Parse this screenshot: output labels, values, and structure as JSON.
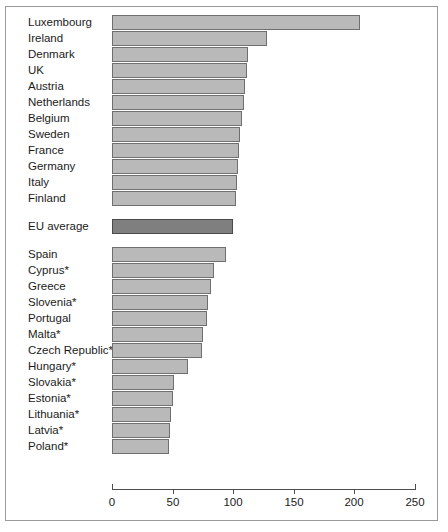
{
  "chart_data": {
    "type": "bar",
    "orientation": "horizontal",
    "title": "",
    "subtitle": "",
    "xlabel": "",
    "ylabel": "",
    "xlim": [
      0,
      250
    ],
    "xticks": [
      0,
      50,
      100,
      150,
      200,
      250
    ],
    "xticklabels": [
      "0",
      "50",
      "100",
      "150",
      "200",
      "250"
    ],
    "grid": false,
    "legend": null,
    "note": "EU average bar drawn in a darker shade; countries marked * are accession/new member states",
    "groups": [
      {
        "name": "above-average",
        "categories": [
          "Luxembourg",
          "Ireland",
          "Denmark",
          "UK",
          "Austria",
          "Netherlands",
          "Belgium",
          "Sweden",
          "France",
          "Germany",
          "Italy",
          "Finland"
        ],
        "values": [
          205,
          128,
          112,
          111,
          110,
          109,
          107,
          106,
          105,
          104,
          103,
          102
        ]
      },
      {
        "name": "average",
        "categories": [
          "EU average"
        ],
        "values": [
          100
        ]
      },
      {
        "name": "below-average",
        "categories": [
          "Spain",
          "Cyprus*",
          "Greece",
          "Slovenia*",
          "Portugal",
          "Malta*",
          "Czech Republic*",
          "Hungary*",
          "Slovakia*",
          "Estonia*",
          "Lithuania*",
          "Latvia*",
          "Poland*"
        ],
        "values": [
          94,
          84,
          82,
          79,
          78,
          75,
          74,
          63,
          51,
          50,
          49,
          48,
          47
        ]
      }
    ],
    "categories": [
      "Luxembourg",
      "Ireland",
      "Denmark",
      "UK",
      "Austria",
      "Netherlands",
      "Belgium",
      "Sweden",
      "France",
      "Germany",
      "Italy",
      "Finland",
      "EU average",
      "Spain",
      "Cyprus*",
      "Greece",
      "Slovenia*",
      "Portugal",
      "Malta*",
      "Czech Republic*",
      "Hungary*",
      "Slovakia*",
      "Estonia*",
      "Lithuania*",
      "Latvia*",
      "Poland*"
    ],
    "values": [
      205,
      128,
      112,
      111,
      110,
      109,
      107,
      106,
      105,
      104,
      103,
      102,
      100,
      94,
      84,
      82,
      79,
      78,
      75,
      74,
      63,
      51,
      50,
      49,
      48,
      47
    ],
    "colors": {
      "bar_fill": "#b9b9b9",
      "bar_stroke": "#6f6f6f",
      "eu_fill": "#7f7f7f",
      "eu_stroke": "#4a4a4a",
      "axis": "#4d4d4d",
      "text": "#1b1b1b",
      "frame": "#9a9a9a",
      "background": "#ffffff"
    }
  }
}
